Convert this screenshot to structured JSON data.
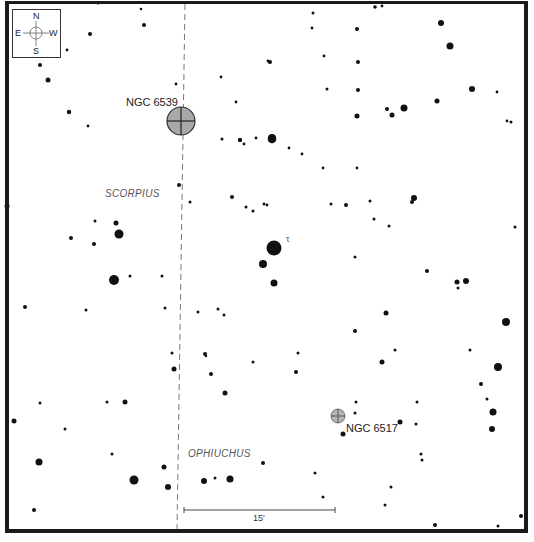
{
  "chart": {
    "compass": {
      "north": "N",
      "south": "S",
      "east": "E",
      "west": "W"
    },
    "constellations": [
      {
        "name": "SCORPIUS",
        "x": 105,
        "y": 197
      },
      {
        "name": "OPHIUCHUS",
        "x": 188,
        "y": 457
      }
    ],
    "boundary_line": {
      "x_top": 185,
      "x_bottom": 177,
      "style": "dashed"
    },
    "objects": [
      {
        "name": "NGC 6539",
        "type": "globular-cluster",
        "x": 181,
        "y": 121,
        "r": 14,
        "label_x": 126,
        "label_y": 101,
        "color": "#a8a8a8"
      },
      {
        "name": "NGC 6517",
        "type": "globular-cluster",
        "x": 338,
        "y": 416,
        "r": 7,
        "label_x": 346,
        "label_y": 424,
        "color": "#b4b4b4"
      }
    ],
    "star_labels": [
      {
        "text": "τ",
        "x": 288,
        "y": 243
      }
    ],
    "scale_bar": {
      "label": "15'",
      "x1": 184,
      "x2": 335,
      "y": 510
    },
    "stars": [
      [
        98,
        3,
        1.5
      ],
      [
        141,
        9,
        1.3
      ],
      [
        144,
        25,
        2
      ],
      [
        90,
        34,
        2
      ],
      [
        67,
        50,
        1.4
      ],
      [
        40,
        65,
        2
      ],
      [
        48,
        80,
        2.5
      ],
      [
        69,
        112,
        2.2
      ],
      [
        88,
        126,
        1.4
      ],
      [
        176,
        84,
        1.4
      ],
      [
        221,
        77,
        1.4
      ],
      [
        236,
        102,
        1.4
      ],
      [
        222,
        139,
        1.5
      ],
      [
        256,
        138,
        1.4
      ],
      [
        240,
        140,
        2.2
      ],
      [
        244,
        144,
        1.4
      ],
      [
        272,
        139,
        4.3
      ],
      [
        313,
        13,
        1.5
      ],
      [
        375,
        7,
        1.8
      ],
      [
        382,
        6,
        1.4
      ],
      [
        312,
        28,
        1.4
      ],
      [
        357,
        29,
        2
      ],
      [
        441,
        23,
        3
      ],
      [
        450,
        46,
        3.5
      ],
      [
        270,
        62,
        2
      ],
      [
        269,
        62,
        1.4
      ],
      [
        324,
        56,
        1.4
      ],
      [
        358,
        62,
        2
      ],
      [
        437,
        101,
        2.5
      ],
      [
        472,
        89,
        3
      ],
      [
        497,
        92,
        1.4
      ],
      [
        507,
        121,
        1.4
      ],
      [
        511,
        122,
        1.5
      ],
      [
        327,
        89,
        1.5
      ],
      [
        358,
        90,
        2
      ],
      [
        387,
        109,
        2
      ],
      [
        392,
        115,
        2.5
      ],
      [
        404,
        108,
        3.5
      ],
      [
        268,
        61,
        1.4
      ],
      [
        272,
        138,
        4
      ],
      [
        289,
        148,
        1.4
      ],
      [
        302,
        154,
        1.4
      ],
      [
        323,
        168,
        1.4
      ],
      [
        357,
        168,
        1.4
      ],
      [
        357,
        116,
        2.5
      ],
      [
        7,
        206,
        2.5
      ],
      [
        179,
        185,
        2
      ],
      [
        190,
        202,
        1.5
      ],
      [
        232,
        197,
        2
      ],
      [
        246,
        207,
        1.5
      ],
      [
        253,
        211,
        1.5
      ],
      [
        95,
        221,
        1.5
      ],
      [
        116,
        223,
        2.5
      ],
      [
        119,
        234,
        4.5
      ],
      [
        71,
        238,
        2
      ],
      [
        94,
        244,
        2
      ],
      [
        114,
        280,
        5
      ],
      [
        130,
        276,
        1.5
      ],
      [
        162,
        276,
        1.5
      ],
      [
        25,
        307,
        2
      ],
      [
        86,
        310,
        1.5
      ],
      [
        165,
        308,
        1.5
      ],
      [
        198,
        312,
        1.5
      ],
      [
        218,
        309,
        1.5
      ],
      [
        224,
        315,
        1.5
      ],
      [
        264,
        204,
        1.5
      ],
      [
        267,
        205,
        1.4
      ],
      [
        331,
        204,
        1.5
      ],
      [
        346,
        205,
        2
      ],
      [
        370,
        201,
        1.5
      ],
      [
        414,
        198,
        3
      ],
      [
        412,
        202,
        2
      ],
      [
        374,
        219,
        1.5
      ],
      [
        389,
        226,
        1.5
      ],
      [
        274,
        248,
        7.5
      ],
      [
        263,
        264,
        4
      ],
      [
        274,
        283,
        3.5
      ],
      [
        355,
        257,
        1.5
      ],
      [
        427,
        271,
        2
      ],
      [
        457,
        282,
        2.5
      ],
      [
        466,
        281,
        3
      ],
      [
        458,
        288,
        1.5
      ],
      [
        515,
        227,
        1.5
      ],
      [
        386,
        313,
        2.5
      ],
      [
        355,
        331,
        2
      ],
      [
        395,
        350,
        1.5
      ],
      [
        506,
        322,
        4
      ],
      [
        470,
        350,
        1.5
      ],
      [
        172,
        353,
        1.5
      ],
      [
        205,
        354,
        2
      ],
      [
        206,
        356,
        1.2
      ],
      [
        298,
        353,
        1.5
      ],
      [
        211,
        374,
        2
      ],
      [
        253,
        362,
        1.5
      ],
      [
        225,
        393,
        2.5
      ],
      [
        174,
        369,
        2.5
      ],
      [
        296,
        372,
        2
      ],
      [
        382,
        362,
        2.5
      ],
      [
        498,
        367,
        4
      ],
      [
        481,
        384,
        2
      ],
      [
        487,
        399,
        1.5
      ],
      [
        493,
        412,
        3.5
      ],
      [
        492,
        429,
        3
      ],
      [
        40,
        403,
        1.5
      ],
      [
        107,
        402,
        1.5
      ],
      [
        125,
        402,
        2.5
      ],
      [
        14,
        421,
        2.5
      ],
      [
        65,
        429,
        1.5
      ],
      [
        356,
        402,
        1.5
      ],
      [
        355,
        413,
        1.5
      ],
      [
        343,
        434,
        2.5
      ],
      [
        400,
        422,
        2.5
      ],
      [
        417,
        402,
        1.5
      ],
      [
        416,
        424,
        1.5
      ],
      [
        39,
        462,
        3.5
      ],
      [
        112,
        454,
        1.5
      ],
      [
        134,
        480,
        4.5
      ],
      [
        164,
        467,
        2.5
      ],
      [
        168,
        487,
        3
      ],
      [
        204,
        481,
        3
      ],
      [
        215,
        478,
        1.5
      ],
      [
        230,
        479,
        3.5
      ],
      [
        263,
        463,
        2
      ],
      [
        315,
        473,
        1.5
      ],
      [
        421,
        454,
        1.5
      ],
      [
        422,
        460,
        1.5
      ],
      [
        391,
        487,
        1.5
      ],
      [
        323,
        497,
        1.5
      ],
      [
        385,
        505,
        1.5
      ],
      [
        34,
        510,
        2
      ],
      [
        435,
        525,
        2
      ],
      [
        521,
        516,
        2
      ],
      [
        498,
        526,
        1.5
      ]
    ]
  }
}
